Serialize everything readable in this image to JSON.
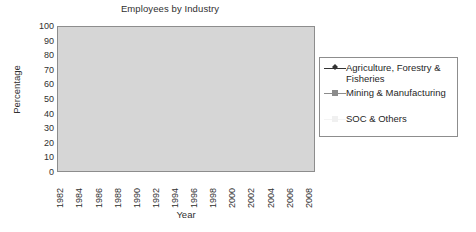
{
  "chart_data": {
    "type": "line",
    "title": "Employees by Industry",
    "xlabel": "Year",
    "ylabel": "Percentage",
    "ylim": [
      0,
      100
    ],
    "ytick_step": 10,
    "yticks": [
      100,
      90,
      80,
      70,
      60,
      50,
      40,
      30,
      20,
      10,
      0
    ],
    "grid": true,
    "legend_position": "right",
    "plot_background": "#d6d6d6",
    "x": [
      1982,
      1983,
      1984,
      1985,
      1986,
      1987,
      1988,
      1989,
      1990,
      1991,
      1992,
      1993,
      1994,
      1995,
      1996,
      1997,
      1998,
      1999,
      2000,
      2001,
      2002,
      2003,
      2004,
      2005,
      2006,
      2007,
      2008
    ],
    "xtick_labels": [
      "1982",
      "1984",
      "1986",
      "1988",
      "1990",
      "1992",
      "1994",
      "1996",
      "1998",
      "2000",
      "2002",
      "2004",
      "2006",
      "2008"
    ],
    "series": [
      {
        "name": "Agriculture, Forestry & Fisheries",
        "color": "#333333",
        "marker": "diamond",
        "values": [
          34,
          33,
          30,
          27.5,
          25.5,
          23.5,
          23,
          22,
          18,
          16,
          15.5,
          14.5,
          13.5,
          12.5,
          12,
          11.5,
          12.5,
          12,
          11.5,
          10.5,
          10,
          9.5,
          9,
          8.5,
          8,
          7.5,
          7.5
        ]
      },
      {
        "name": "Mining & Manufacturing",
        "color": "#8c8c8c",
        "marker": "square",
        "values": [
          21,
          21.5,
          22.5,
          23.5,
          25,
          27.5,
          27.5,
          27.5,
          27,
          26.5,
          25.5,
          24.5,
          24,
          23.5,
          22.5,
          21,
          19.5,
          19.5,
          20,
          19.5,
          19,
          18.5,
          18.5,
          18,
          18,
          17,
          16.5
        ]
      },
      {
        "name": "SOC & Others",
        "color": "#f2f2f2",
        "marker": "square",
        "values": [
          42,
          44,
          46,
          47.5,
          48,
          48.5,
          49,
          49.5,
          53,
          55.5,
          58,
          60,
          61.5,
          63,
          65,
          67,
          67.5,
          68.5,
          69,
          70,
          70.5,
          71.5,
          72.5,
          73.5,
          74,
          74.5,
          75
        ]
      }
    ]
  },
  "legend": {
    "items": [
      {
        "label": "Agriculture, Forestry & Fisheries"
      },
      {
        "label": "Mining & Manufacturing"
      },
      {
        "label": "SOC & Others"
      }
    ]
  }
}
